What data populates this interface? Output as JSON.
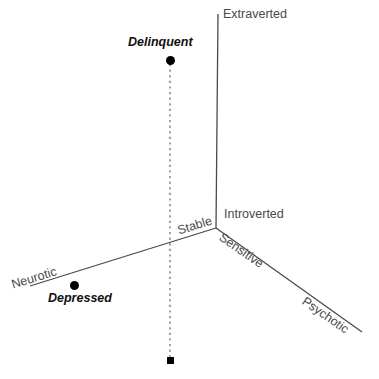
{
  "diagram": {
    "title": "",
    "type": "three-axis-personality-space",
    "background_color": "#ffffff",
    "line_color": "#4a4a4a",
    "marker_color": "#000000",
    "axes": [
      {
        "id": "vertical",
        "pole_label": "Extraverted",
        "opposite_label": "Introverted",
        "from": [
          216,
          228
        ],
        "to": [
          218,
          14
        ]
      },
      {
        "id": "left-diagonal",
        "pole_label": "Neurotic",
        "opposite_label": "Stable",
        "from": [
          216,
          228
        ],
        "to": [
          30,
          286
        ]
      },
      {
        "id": "right-diagonal",
        "pole_label": "Psychotic",
        "opposite_label": "Sensitive",
        "from": [
          216,
          228
        ],
        "to": [
          362,
          332
        ]
      }
    ],
    "axis_labels": [
      {
        "name": "extraverted",
        "text": "Extraverted",
        "x": 223,
        "y": 8,
        "rotation": 0
      },
      {
        "name": "introverted",
        "text": "Introverted",
        "x": 224,
        "y": 208,
        "rotation": 0
      },
      {
        "name": "stable",
        "text": "Stable",
        "x": 176,
        "y": 225,
        "rotation": -17
      },
      {
        "name": "neurotic",
        "text": "Neurotic",
        "x": 10,
        "y": 279,
        "rotation": -17
      },
      {
        "name": "sensitive",
        "text": "Sensitive",
        "x": 224,
        "y": 231,
        "rotation": 35
      },
      {
        "name": "psychotic",
        "text": "Psychotic",
        "x": 307,
        "y": 295,
        "rotation": 35
      }
    ],
    "points": [
      {
        "name": "delinquent",
        "label": "Delinquent",
        "marker": "circle",
        "marker_x": 170,
        "marker_y": 60,
        "label_x": 128,
        "label_y": 36
      },
      {
        "name": "depressed",
        "label": "Depressed",
        "marker": "circle",
        "marker_x": 74,
        "marker_y": 285,
        "label_x": 48,
        "label_y": 292
      }
    ],
    "projection": {
      "name": "delinquent-projection",
      "style": "dashed",
      "from": [
        170,
        64
      ],
      "to": [
        170,
        358
      ],
      "foot_marker": "square",
      "foot_x": 170,
      "foot_y": 360
    }
  }
}
